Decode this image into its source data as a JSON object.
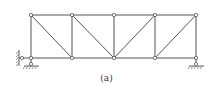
{
  "caption": "(a)",
  "colors": {
    "line": "#555555",
    "node_fill": "#ffffff",
    "hatch": "#666666"
  },
  "nodes": {
    "top": [
      [
        31,
        15
      ],
      [
        72,
        15
      ],
      [
        114,
        15
      ],
      [
        155,
        15
      ],
      [
        196,
        15
      ]
    ],
    "bottom": [
      [
        31,
        58
      ],
      [
        72,
        58
      ],
      [
        114,
        58
      ],
      [
        155,
        58
      ],
      [
        196,
        58
      ]
    ]
  },
  "members": [
    [
      31,
      15,
      72,
      15
    ],
    [
      72,
      15,
      114,
      15
    ],
    [
      114,
      15,
      155,
      15
    ],
    [
      155,
      15,
      196,
      15
    ],
    [
      31,
      58,
      72,
      58
    ],
    [
      72,
      58,
      114,
      58
    ],
    [
      114,
      58,
      155,
      58
    ],
    [
      155,
      58,
      196,
      58
    ],
    [
      31,
      15,
      31,
      58
    ],
    [
      72,
      15,
      72,
      58
    ],
    [
      114,
      15,
      114,
      58
    ],
    [
      155,
      15,
      155,
      58
    ],
    [
      196,
      15,
      196,
      58
    ],
    [
      31,
      15,
      72,
      58
    ],
    [
      72,
      15,
      114,
      58
    ],
    [
      155,
      15,
      114,
      58
    ],
    [
      196,
      15,
      155,
      58
    ]
  ],
  "supports": {
    "left": {
      "type": "pin-with-horizontal-link",
      "x": 31,
      "y": 58
    },
    "right": {
      "type": "roller",
      "x": 196,
      "y": 58
    }
  }
}
